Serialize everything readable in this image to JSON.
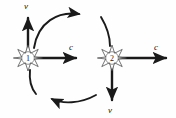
{
  "figure": {
    "background_color": "#fefefe",
    "ink_color": "#1a1a1a",
    "width": 176,
    "height": 118
  },
  "nodes": [
    {
      "id": "node-1",
      "label": "1",
      "shape": "eight-pointed-star",
      "cx": 28,
      "cy": 58,
      "radius": 13
    },
    {
      "id": "node-2",
      "label": "2",
      "shape": "eight-pointed-star",
      "cx": 112,
      "cy": 58,
      "radius": 13
    }
  ],
  "vectors": [
    {
      "id": "node1-velocity",
      "label": "v",
      "direction": "up",
      "from_node": "node-1",
      "label_x": 26,
      "label_y": 9
    },
    {
      "id": "node1-lightspeed",
      "label": "c",
      "direction": "right",
      "from_node": "node-1",
      "label_x": 71,
      "label_y": 50
    },
    {
      "id": "node2-lightspeed",
      "label": "c",
      "direction": "right",
      "from_node": "node-2",
      "label_x": 156,
      "label_y": 50
    },
    {
      "id": "node2-velocity",
      "label": "v",
      "direction": "down",
      "from_node": "node-2",
      "label_x": 110,
      "label_y": 113
    }
  ],
  "arcs": [
    {
      "id": "arc-top",
      "direction": "clockwise-right",
      "description": "curved arrow from node 1 region arcing over the top toward node 2"
    },
    {
      "id": "arc-bottom",
      "direction": "counterclockwise-left",
      "description": "curved arrow from node 2 region arcing under the bottom back toward node 1"
    }
  ]
}
